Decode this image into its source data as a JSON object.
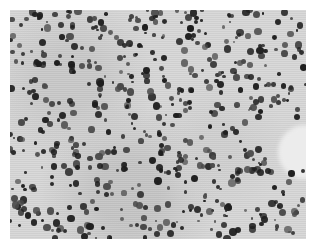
{
  "image": {
    "description": "Grayscale light-microscopy field of densely scattered dark round cells on a speckled light-gray background",
    "frame": {
      "x": 10,
      "y": 10,
      "width": 296,
      "height": 229
    },
    "colors": {
      "background": "#d6d6d6",
      "cell_dark": "#1e1e1e",
      "cell_mid": "#4a4a4a",
      "clear_region": "#ececec",
      "border": "#ffffff"
    },
    "clear_region": {
      "label": "cell-free area",
      "x": 268,
      "y": 115,
      "width": 40,
      "height": 54
    },
    "cell_count_approx": 600,
    "seed": 7
  }
}
